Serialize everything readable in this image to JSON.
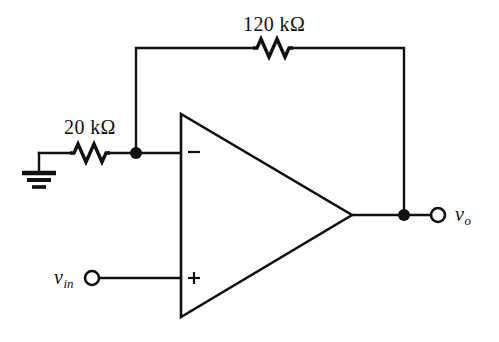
{
  "figure": {
    "kind": "schematic",
    "background_color": "#ffffff",
    "line_color": "#111111"
  },
  "components": {
    "feedback_resistor": {
      "label": "120 kΩ",
      "value": 120,
      "unit": "kΩ",
      "name": "feedback-resistor"
    },
    "input_resistor": {
      "label": "20 kΩ",
      "value": 20,
      "unit": "kΩ",
      "name": "input-resistor"
    },
    "opamp": {
      "inverting_mark": "−",
      "noninverting_mark": "+"
    }
  },
  "terminals": {
    "input": {
      "label_main": "v",
      "label_sub": "in"
    },
    "output": {
      "label_main": "v",
      "label_sub": "o"
    },
    "ground": {
      "name": "ground-symbol"
    }
  }
}
